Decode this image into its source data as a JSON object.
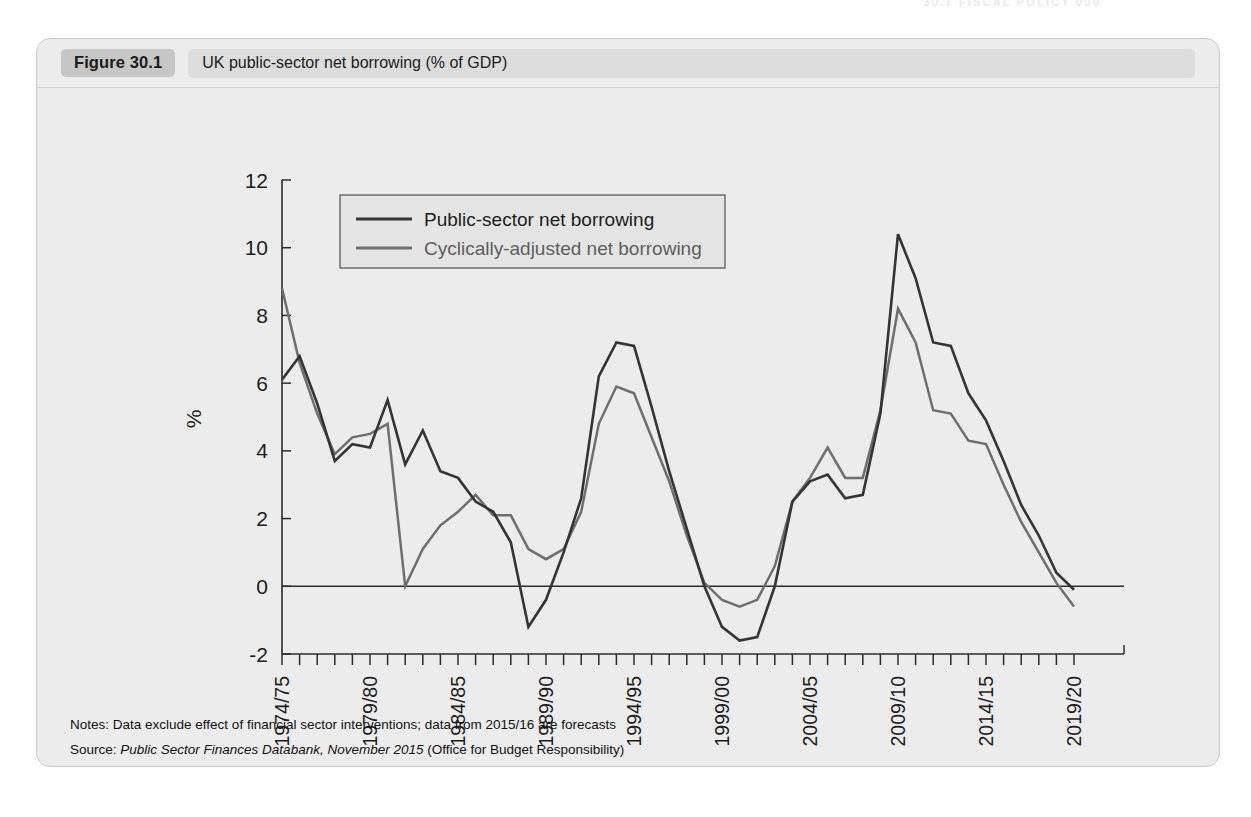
{
  "running_header": "30.1 FISCAL POLICY 000",
  "figure": {
    "number": "Figure 30.1",
    "caption": "UK public-sector net borrowing (% of GDP)"
  },
  "notes": {
    "notes_label": "Notes:",
    "notes_text": "Data exclude effect of financial sector interventions; data from 2015/16 are forecasts",
    "source_label": "Source:",
    "source_italic": "Public Sector Finances Databank, November 2015",
    "source_tail": "(Office for Budget Responsibility)"
  },
  "chart_data": {
    "type": "line",
    "title": "UK public-sector net borrowing (% of GDP)",
    "xlabel": "",
    "ylabel": "%",
    "ylim": [
      -2,
      12
    ],
    "yticks": [
      -2,
      0,
      2,
      4,
      6,
      8,
      10,
      12
    ],
    "grid": false,
    "zero_line": true,
    "legend_position": "top-left-inside",
    "x": [
      "1974/75",
      "1975/76",
      "1976/77",
      "1977/78",
      "1978/79",
      "1979/80",
      "1980/81",
      "1981/82",
      "1982/83",
      "1983/84",
      "1984/85",
      "1985/86",
      "1986/87",
      "1987/88",
      "1988/89",
      "1989/90",
      "1990/91",
      "1991/92",
      "1992/93",
      "1993/94",
      "1994/95",
      "1995/96",
      "1996/97",
      "1997/98",
      "1998/99",
      "1999/00",
      "2000/01",
      "2001/02",
      "2002/03",
      "2003/04",
      "2004/05",
      "2005/06",
      "2006/07",
      "2007/08",
      "2008/09",
      "2009/10",
      "2010/11",
      "2011/12",
      "2012/13",
      "2013/14",
      "2014/15",
      "2015/16",
      "2016/17",
      "2017/18",
      "2018/19",
      "2019/20"
    ],
    "xtick_labels": [
      "1974/75",
      "1979/80",
      "1984/85",
      "1989/90",
      "1994/95",
      "1999/00",
      "2004/05",
      "2009/10",
      "2014/15",
      "2019/20"
    ],
    "xtick_label_interval": 5,
    "series": [
      {
        "name": "Public-sector net borrowing",
        "color": "#343434",
        "values": [
          6.1,
          6.8,
          5.4,
          3.7,
          4.2,
          4.1,
          5.5,
          3.6,
          4.6,
          3.4,
          3.2,
          2.5,
          2.2,
          1.3,
          -1.2,
          -0.4,
          1.0,
          2.6,
          6.2,
          7.2,
          7.1,
          5.3,
          3.4,
          1.7,
          0.0,
          -1.2,
          -1.6,
          -1.5,
          0.0,
          2.5,
          3.1,
          3.3,
          2.6,
          2.7,
          5.1,
          10.4,
          9.1,
          7.2,
          7.1,
          5.7,
          4.9,
          3.7,
          2.4,
          1.5,
          0.4,
          -0.1
        ]
      },
      {
        "name": "Cyclically-adjusted net borrowing",
        "color": "#6e6e6e",
        "values": [
          8.8,
          6.6,
          5.1,
          3.9,
          4.4,
          4.5,
          4.8,
          0.0,
          1.1,
          1.8,
          2.2,
          2.7,
          2.1,
          2.1,
          1.1,
          0.8,
          1.1,
          2.2,
          4.8,
          5.9,
          5.7,
          4.4,
          3.1,
          1.5,
          0.1,
          -0.4,
          -0.6,
          -0.4,
          0.6,
          2.5,
          3.2,
          4.1,
          3.2,
          3.2,
          5.2,
          8.2,
          7.2,
          5.2,
          5.1,
          4.3,
          4.2,
          3.0,
          1.9,
          1.0,
          0.1,
          -0.6
        ]
      }
    ],
    "legend": [
      {
        "label": "Public-sector net borrowing",
        "color": "#343434"
      },
      {
        "label": "Cyclically-adjusted net borrowing",
        "color": "#6e6e6e"
      }
    ]
  }
}
